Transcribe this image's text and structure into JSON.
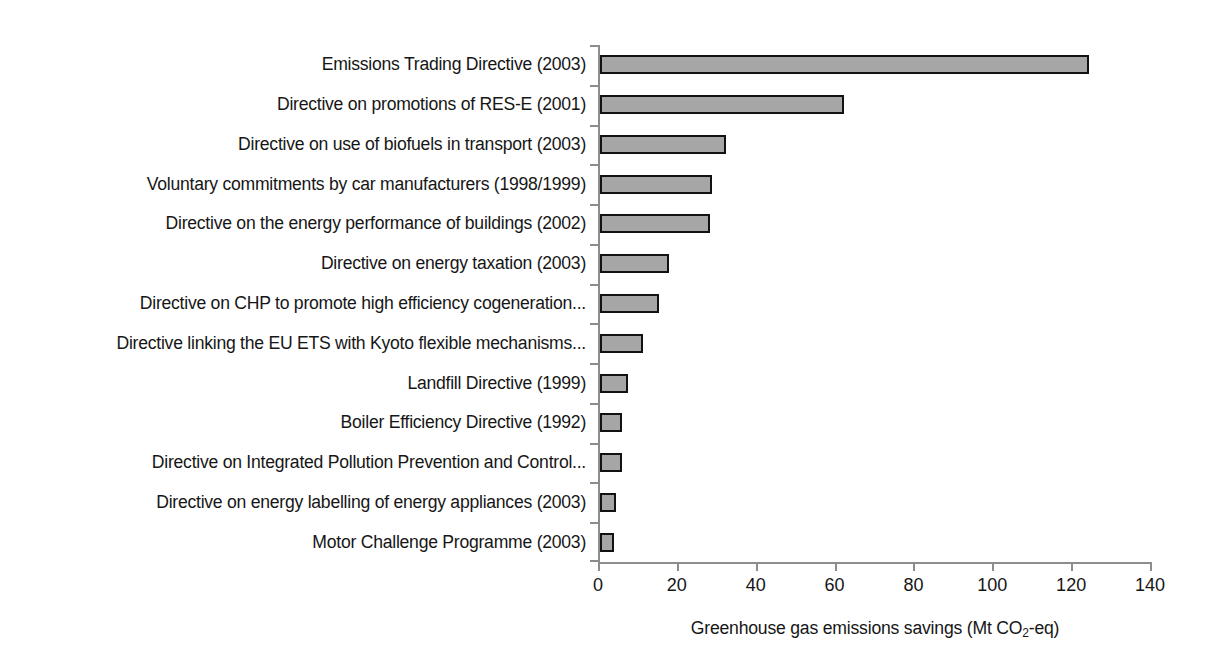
{
  "chart_data": {
    "type": "bar",
    "orientation": "horizontal",
    "title": "",
    "xlabel": "Greenhouse gas emissions savings (Mt CO2-eq)",
    "xlabel_parts": {
      "before": "Greenhouse gas emissions savings (Mt CO",
      "subscript": "2",
      "after": "-eq)"
    },
    "ylabel": "",
    "xlim": [
      0,
      140
    ],
    "xticks": [
      0,
      20,
      40,
      60,
      80,
      100,
      120,
      140
    ],
    "xtick_labels": [
      "0",
      "20",
      "40",
      "60",
      "80",
      "100",
      "120",
      "140"
    ],
    "grid": false,
    "legend": false,
    "bar_fill_color": "#a6a6a6",
    "bar_border_color": "#121212",
    "axis_color": "#8d8d8d",
    "background_color": "#ffffff",
    "categories": [
      "Emissions Trading Directive (2003)",
      "Directive on promotions of RES-E (2001)",
      "Directive on use of biofuels in transport (2003)",
      "Voluntary commitments by car manufacturers (1998/1999)",
      "Directive on the energy performance of buildings (2002)",
      "Directive on energy taxation (2003)",
      "Directive on CHP to promote high efficiency cogeneration...",
      "Directive linking the EU ETS with Kyoto flexible mechanisms...",
      "Landfill Directive (1999)",
      "Boiler Efficiency Directive (1992)",
      "Directive on Integrated Pollution Prevention and Control...",
      "Directive on energy labelling of energy appliances (2003)",
      "Motor Challenge Programme (2003)"
    ],
    "values": [
      124,
      62,
      32,
      28.5,
      28,
      17.5,
      15,
      11,
      7,
      5.5,
      5.5,
      4,
      3.5
    ]
  }
}
